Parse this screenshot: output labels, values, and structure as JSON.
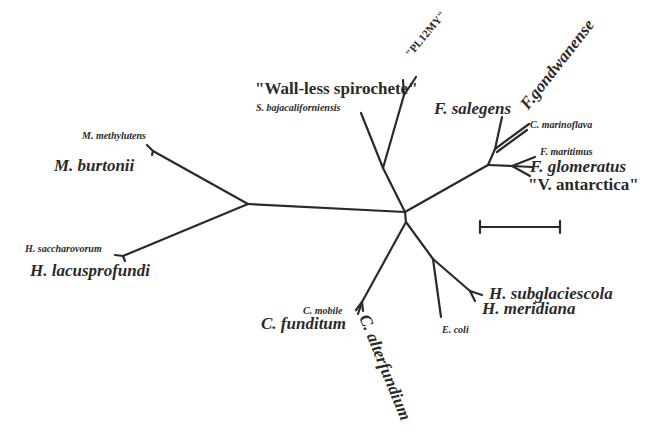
{
  "diagram": {
    "type": "unrooted-phylogenetic-tree",
    "line_color": "#2a2a2a",
    "background": "#ffffff",
    "scale_bar": {
      "label": ""
    }
  },
  "labels": {
    "m_methylutens": "M. methylutens",
    "m_burtonii": "M. burtonii",
    "h_saccharovorum": "H. saccharovorum",
    "h_lacusprofundi": "H. lacusprofundi",
    "wall_less": "\"Wall-less spirochete\"",
    "pl12my": "\"PL12MY\"",
    "s_baja": "S. bajacaliforniensis",
    "f_salegens": "F. salegens",
    "f_gondwanense": "F.gondwanense",
    "c_marinoflava": "C. marinoflava",
    "f_maritimus": "F. maritimus",
    "f_glomeratus": "F. glomeratus",
    "v_antarctica": "\"V.  antarctica\"",
    "c_mobile": "C. mobile",
    "c_funditum": "C. funditum",
    "c_alterfundium": "C. alterfundium",
    "e_coli": "E. coli",
    "h_subglaciescola": "H. subglaciescola",
    "h_meridiana": "H. meridiana"
  }
}
